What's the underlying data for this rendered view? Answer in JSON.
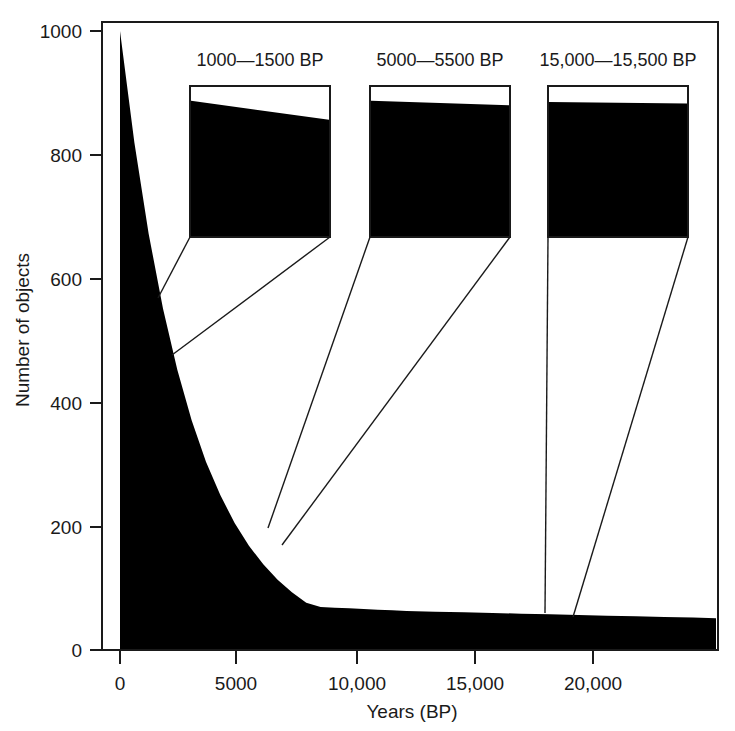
{
  "figure": {
    "background_color": "#ffffff",
    "fill_color": "#000000",
    "line_color": "#1a1a1a"
  },
  "axes": {
    "xlabel": "Years (BP)",
    "ylabel": "Number of objects",
    "x_ticks": [
      "0",
      "5000",
      "10,000",
      "15,000",
      "20,000"
    ],
    "y_ticks": [
      "0",
      "200",
      "400",
      "600",
      "800",
      "1000"
    ]
  },
  "insets": [
    {
      "title": "1000—1500 BP",
      "left_value": 908,
      "right_value": 780,
      "range_start": 1000,
      "range_end": 1500
    },
    {
      "title": "5000—5500 BP",
      "left_value": 908,
      "right_value": 878,
      "range_start": 5000,
      "range_end": 5500
    },
    {
      "title": "15,000—15,500 BP",
      "left_value": 900,
      "right_value": 890,
      "range_start": 15000,
      "range_end": 15500
    }
  ],
  "chart_data": {
    "type": "area",
    "title": "",
    "xlabel": "Years (BP)",
    "ylabel": "Number of objects",
    "xlim": [
      0,
      20800
    ],
    "ylim": [
      0,
      1000
    ],
    "x_ticks": [
      0,
      5000,
      10000,
      15000,
      20000
    ],
    "y_ticks": [
      0,
      200,
      400,
      600,
      800,
      1000
    ],
    "grid": false,
    "legend": "none",
    "series": [
      {
        "name": "Number of objects surviving",
        "model": "exponential decay",
        "x": [
          0,
          500,
          1000,
          1500,
          2000,
          2500,
          3000,
          3500,
          4000,
          4500,
          5000,
          5500,
          6000,
          6500,
          7000,
          7500,
          8000,
          8500,
          9000,
          9500,
          10000,
          11000,
          12000,
          13000,
          14000,
          15000,
          16000,
          17000,
          18000,
          19000,
          20000,
          20800
        ],
        "values": [
          1000,
          820,
          672,
          551,
          452,
          370,
          303,
          249,
          204,
          167,
          137,
          112,
          92,
          75,
          62,
          51,
          41,
          34,
          28,
          23,
          19,
          12.5,
          8.4,
          5.6,
          3.7,
          2.5,
          1.7,
          1.1,
          0.75,
          0.5,
          0.33,
          0.25
        ]
      }
    ],
    "annotations": [
      {
        "label": "1000—1500 BP",
        "x_range": [
          1000,
          1500
        ]
      },
      {
        "label": "5000—5500 BP",
        "x_range": [
          5000,
          5500
        ]
      },
      {
        "label": "15,000—15,500 BP",
        "x_range": [
          15000,
          15500
        ]
      }
    ]
  }
}
